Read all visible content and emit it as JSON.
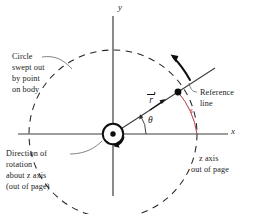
{
  "figure": {
    "kind": "physics-diagram",
    "background": "#ffffff",
    "colors": {
      "axis": "#3a3a3a",
      "ink": "#1a1a1a",
      "arc_s": "#b03a48",
      "dashed_circle": "#2b2b2b"
    }
  },
  "axes": {
    "y_label": "y",
    "x_label": "x"
  },
  "math_labels": {
    "radius_vector": "r",
    "angle": "θ",
    "arc_length": "s"
  },
  "annotations": {
    "circle_swept": {
      "lines": [
        "Circle",
        "swept out",
        "by point",
        "on body"
      ]
    },
    "direction_of_rotation": {
      "lines": [
        "Direction of",
        "rotation",
        "about z axis",
        "(out of page)"
      ]
    },
    "reference_line": {
      "lines": [
        "Reference",
        "line"
      ]
    },
    "z_axis": {
      "lines": [
        "z axis",
        "out of page"
      ]
    }
  },
  "geometry": {
    "origin": {
      "x": 113,
      "y": 134
    },
    "circle_radius": 84,
    "reference_line_angle_deg": 33,
    "point_on_body": {
      "x": 178,
      "y": 92
    },
    "x_axis_label_pos": {
      "x": 232,
      "y": 131
    },
    "y_axis_label_pos": {
      "x": 118,
      "y": 6
    }
  }
}
